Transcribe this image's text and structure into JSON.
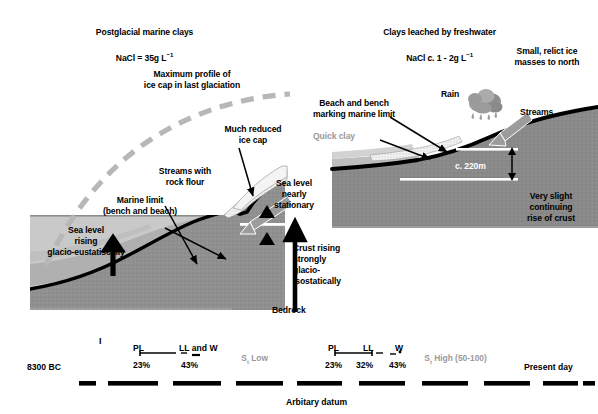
{
  "figure": {
    "title_left": "Postglacial marine clays",
    "subtitle_left": "NaCl = 35g L",
    "subtitle_left_sup": "−1",
    "title_right": "Clays leached by freshwater",
    "subtitle_right_a": "NaCl ",
    "subtitle_right_ital": "c.",
    "subtitle_right_b": " 1 - 2g L",
    "subtitle_right_sup": "−1"
  },
  "left_panel": {
    "ice_profile_label": "Maximum profile of\nice cap in last glaciation",
    "marine_limit_label": "Marine limit\n(bench and beach)",
    "streams_label": "Streams with\nrock flour",
    "reduced_icecap_label": "Much reduced\nice cap",
    "sea_level_label": "Sea level\nrising\nglacio-eustatiscally",
    "crust_label": "Crust rising\nstrongly\nglacio-\nisostatically",
    "bedrock_label": "Bedrock"
  },
  "right_panel": {
    "small_ice_label": "Small, relict ice\nmasses to north",
    "rain_label": "Rain",
    "beach_bench_label": "Beach and bench\nmarking marine limit",
    "quick_clay_label": "Quick clay",
    "streams_label": "Streams",
    "sea_level_label": "Sea level\nnearly\nstationary",
    "elevation_label": "c. 220m",
    "crust_label": "Very slight\ncontinuing\nrise of crust"
  },
  "timeline": {
    "start_label": "8300 BC",
    "end_label": "Present day",
    "datum_label": "Arbitary datum",
    "group_left": {
      "pl": "PL",
      "ll_w": "LL and W",
      "sensitivity": "S",
      "sensitivity_sub": "t",
      "sensitivity_value": " Low",
      "pct_pl": "23%",
      "pct_ll": "43%"
    },
    "group_right": {
      "pl": "PL",
      "ll": "LL",
      "w": "W",
      "sensitivity": "S",
      "sensitivity_sub": "t",
      "sensitivity_value": " High (50-100)",
      "pct_pl": "23%",
      "pct_ll": "32%",
      "pct_w": "43%"
    },
    "tick_marker": "I"
  },
  "colors": {
    "bedrock": "#8f8f8f",
    "bedrock_dark": "#6f6f6f",
    "marine_clay": "#b4b4b4",
    "sea": "#c9c9c9",
    "ice_gray": "#b5b5b5",
    "black": "#000000",
    "quick_clay_text": "#9a9a9a"
  }
}
